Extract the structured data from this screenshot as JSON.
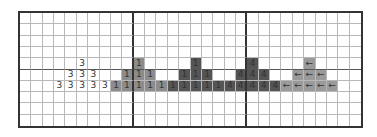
{
  "grid": {
    "columns": 30,
    "rows": 10,
    "major_column_every": 10,
    "major_row_at": 5,
    "colors": {
      "background": "#ffffff",
      "grid_line": "#b8b8b8",
      "major_line": "#333333",
      "shade_three": "#ffffff",
      "shade_one_light": "#8c8c8c",
      "shade_one_dark": "#555555",
      "shade_four": "#555555",
      "shade_arrow": "#9a9a9a",
      "text": "#333333"
    },
    "cells": [
      {
        "row": 4,
        "col": 5,
        "text": "3",
        "shade": "shade_three"
      },
      {
        "row": 5,
        "col": 4,
        "text": "3",
        "shade": "shade_three"
      },
      {
        "row": 5,
        "col": 5,
        "text": "3",
        "shade": "shade_three"
      },
      {
        "row": 5,
        "col": 6,
        "text": "3",
        "shade": "shade_three"
      },
      {
        "row": 6,
        "col": 3,
        "text": "3",
        "shade": "shade_three"
      },
      {
        "row": 6,
        "col": 4,
        "text": "3",
        "shade": "shade_three"
      },
      {
        "row": 6,
        "col": 5,
        "text": "3",
        "shade": "shade_three"
      },
      {
        "row": 6,
        "col": 6,
        "text": "3",
        "shade": "shade_three"
      },
      {
        "row": 6,
        "col": 7,
        "text": "3",
        "shade": "shade_three"
      },
      {
        "row": 4,
        "col": 10,
        "text": "1",
        "shade": "shade_one_light"
      },
      {
        "row": 5,
        "col": 9,
        "text": "1",
        "shade": "shade_one_light"
      },
      {
        "row": 5,
        "col": 10,
        "text": "1",
        "shade": "shade_one_light"
      },
      {
        "row": 5,
        "col": 11,
        "text": "1",
        "shade": "shade_one_light"
      },
      {
        "row": 6,
        "col": 8,
        "text": "1",
        "shade": "shade_one_light"
      },
      {
        "row": 6,
        "col": 9,
        "text": "1",
        "shade": "shade_one_light"
      },
      {
        "row": 6,
        "col": 10,
        "text": "1",
        "shade": "shade_one_light"
      },
      {
        "row": 6,
        "col": 11,
        "text": "1",
        "shade": "shade_one_light"
      },
      {
        "row": 6,
        "col": 12,
        "text": "1",
        "shade": "shade_one_light"
      },
      {
        "row": 4,
        "col": 15,
        "text": "1",
        "shade": "shade_one_dark"
      },
      {
        "row": 5,
        "col": 14,
        "text": "1",
        "shade": "shade_one_dark"
      },
      {
        "row": 5,
        "col": 15,
        "text": "1",
        "shade": "shade_one_dark"
      },
      {
        "row": 5,
        "col": 16,
        "text": "1",
        "shade": "shade_one_dark"
      },
      {
        "row": 6,
        "col": 13,
        "text": "1",
        "shade": "shade_one_dark"
      },
      {
        "row": 6,
        "col": 14,
        "text": "1",
        "shade": "shade_one_dark"
      },
      {
        "row": 6,
        "col": 15,
        "text": "1",
        "shade": "shade_one_dark"
      },
      {
        "row": 6,
        "col": 16,
        "text": "1",
        "shade": "shade_one_dark"
      },
      {
        "row": 6,
        "col": 17,
        "text": "1",
        "shade": "shade_one_dark"
      },
      {
        "row": 4,
        "col": 20,
        "text": "4",
        "shade": "shade_four"
      },
      {
        "row": 5,
        "col": 19,
        "text": "4",
        "shade": "shade_four"
      },
      {
        "row": 5,
        "col": 20,
        "text": "4",
        "shade": "shade_four"
      },
      {
        "row": 5,
        "col": 21,
        "text": "4",
        "shade": "shade_four"
      },
      {
        "row": 6,
        "col": 18,
        "text": "4",
        "shade": "shade_four"
      },
      {
        "row": 6,
        "col": 19,
        "text": "4",
        "shade": "shade_four"
      },
      {
        "row": 6,
        "col": 20,
        "text": "4",
        "shade": "shade_four"
      },
      {
        "row": 6,
        "col": 21,
        "text": "4",
        "shade": "shade_four"
      },
      {
        "row": 6,
        "col": 22,
        "text": "4",
        "shade": "shade_four"
      },
      {
        "row": 4,
        "col": 25,
        "text": "←",
        "shade": "shade_arrow"
      },
      {
        "row": 5,
        "col": 24,
        "text": "←",
        "shade": "shade_arrow"
      },
      {
        "row": 5,
        "col": 25,
        "text": "←",
        "shade": "shade_arrow"
      },
      {
        "row": 5,
        "col": 26,
        "text": "←",
        "shade": "shade_arrow"
      },
      {
        "row": 6,
        "col": 23,
        "text": "←",
        "shade": "shade_arrow"
      },
      {
        "row": 6,
        "col": 24,
        "text": "←",
        "shade": "shade_arrow"
      },
      {
        "row": 6,
        "col": 25,
        "text": "←",
        "shade": "shade_arrow"
      },
      {
        "row": 6,
        "col": 26,
        "text": "←",
        "shade": "shade_arrow"
      },
      {
        "row": 6,
        "col": 27,
        "text": "←",
        "shade": "shade_arrow"
      }
    ]
  }
}
